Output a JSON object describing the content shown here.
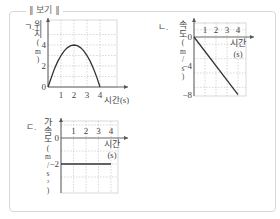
{
  "box_title": "∥ 보기 ∥",
  "chart_data": [
    {
      "id": "a",
      "item_label": "ㄱ.",
      "type": "line",
      "ylabel": "위치(m)",
      "xlabel": "시간(s)",
      "x_ticks": [
        "1",
        "2",
        "3",
        "4"
      ],
      "y_ticks": [
        "0",
        "2",
        "4"
      ],
      "xlim": [
        0,
        4.6
      ],
      "ylim": [
        0,
        5
      ],
      "grid": true,
      "series": [
        {
          "name": "position",
          "x": [
            0,
            0.25,
            0.5,
            0.75,
            1,
            1.25,
            1.5,
            1.75,
            2,
            2.25,
            2.5,
            2.75,
            3,
            3.25,
            3.5,
            3.75,
            4
          ],
          "y": [
            0,
            0.875,
            1.75,
            2.4375,
            3,
            3.4375,
            3.75,
            3.9375,
            4,
            3.9375,
            3.75,
            3.4375,
            3,
            2.4375,
            1.75,
            0.9375,
            0
          ]
        }
      ]
    },
    {
      "id": "b",
      "item_label": "ㄴ.",
      "type": "line",
      "ylabel": "속도(m/s)",
      "xlabel": "시간(s)",
      "x_ticks": [
        "1",
        "2",
        "3",
        "4"
      ],
      "y_ticks": [
        "0",
        "−4",
        "−8"
      ],
      "xlim": [
        0,
        4.6
      ],
      "ylim": [
        -9,
        1
      ],
      "grid": true,
      "series": [
        {
          "name": "velocity",
          "x": [
            0,
            4
          ],
          "y": [
            0,
            -8
          ]
        }
      ]
    },
    {
      "id": "c",
      "item_label": "ㄷ.",
      "type": "line",
      "ylabel": "가속도(m/s²)",
      "xlabel": "시간(s)",
      "x_ticks": [
        "1",
        "2",
        "3",
        "4"
      ],
      "y_ticks": [
        "0",
        "−2"
      ],
      "xlim": [
        0,
        4.6
      ],
      "ylim": [
        -3,
        1.5
      ],
      "grid": true,
      "series": [
        {
          "name": "acceleration",
          "x": [
            0,
            4
          ],
          "y": [
            -2,
            -2
          ]
        }
      ]
    }
  ]
}
